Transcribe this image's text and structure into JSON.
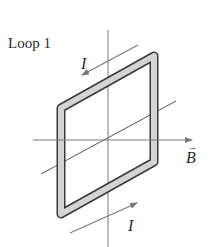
{
  "figure": {
    "title": "Loop 1",
    "current_label_top": "I",
    "current_label_bottom": "I",
    "field_label": "B",
    "field_vector_mark": "→",
    "colors": {
      "axis": "#7a7a7a",
      "loop_outline": "#3a3a3a",
      "loop_fill": "#d4d4d4",
      "text": "#2a2a2a"
    }
  }
}
